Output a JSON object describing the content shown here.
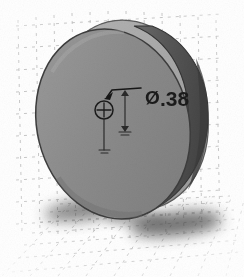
{
  "viewport": {
    "width": 244,
    "height": 277,
    "background_color": "#ffffff",
    "title": "Isometric CAD view of cylindrical disc"
  },
  "scene": {
    "name": "isometric-cad-disc-scene",
    "description": "Grayscale shaded 3D cylinder (disc / puck) rendered in isometric view on a faint dashed reference grid with a soft cast shadow"
  },
  "grid": {
    "name": "reference-grid",
    "style": "dashed",
    "color": "#b9b9b9",
    "planes": [
      {
        "id": "back-plane",
        "label": "vertical back reference plane"
      },
      {
        "id": "ground-plane",
        "label": "horizontal ground reference plane"
      }
    ],
    "dash_pattern": "3 5",
    "opacity": 0.75
  },
  "shadow": {
    "name": "cast-shadow",
    "color": "#4d4d4d",
    "blur": 9,
    "opacity": 0.72
  },
  "model": {
    "name": "cylinder-disc",
    "type": "cylinder",
    "faces": [
      {
        "id": "back-face",
        "label": "rear circular face",
        "fill": "#a8a8a8",
        "stroke": "#5a5a5a"
      },
      {
        "id": "rim-face",
        "label": "cylindrical side wall",
        "fill": "#5e5e5e",
        "stroke": "#343434"
      },
      {
        "id": "front-face",
        "label": "front circular face",
        "fill": "#8d8d8d",
        "stroke": "#3c3c3c"
      }
    ],
    "highlight_color": "#bdbdbd",
    "shade_color": "#4a4a4a"
  },
  "annotation": {
    "name": "diameter-dimension",
    "symbol": "Ø",
    "value": ".38",
    "full_text": "Ø .38",
    "color": "#1b1b1b",
    "font_size": 20,
    "leader": {
      "name": "leader-line",
      "color": "#1b1b1b",
      "from": "hole-center-marker",
      "to": "dimension-text"
    },
    "hole_marker": {
      "name": "hole-center-marker",
      "glyph": "crosshair-circle",
      "color": "#1b1b1b",
      "radius": 9
    },
    "extension_lines": [
      {
        "name": "vertical-dimension-line",
        "color": "#2a2a2a"
      },
      {
        "name": "center-axis-line",
        "color": "#2a2a2a"
      }
    ],
    "arrows": [
      {
        "name": "arrow-up",
        "direction": "up"
      },
      {
        "name": "arrow-down",
        "direction": "down"
      }
    ]
  }
}
